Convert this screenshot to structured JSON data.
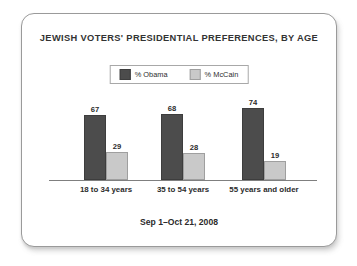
{
  "card": {
    "border_color": "#9a9a9a",
    "background": "#ffffff"
  },
  "chart_data": {
    "type": "bar",
    "title": "JEWISH VOTERS' PRESIDENTIAL PREFERENCES, BY AGE",
    "subtitle": "Sep 1–Oct 21, 2008",
    "xlabel": "",
    "ylabel": "",
    "ylim": [
      0,
      80
    ],
    "grid": false,
    "legend_position": "top-center",
    "categories": [
      "18 to 34 years",
      "35 to 54 years",
      "55 years and older"
    ],
    "series": [
      {
        "name": "% Obama",
        "color": "#4c4c4c",
        "values": [
          67,
          68,
          74
        ]
      },
      {
        "name": "% McCain",
        "color": "#c9c9c9",
        "values": [
          29,
          28,
          19
        ]
      }
    ]
  }
}
